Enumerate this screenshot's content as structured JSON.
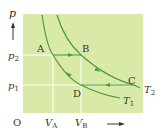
{
  "figure": {
    "type": "p-V diagram",
    "colors": {
      "background": "#ffffff",
      "plot_area": "#d9eaa8",
      "curve": "#4f9a3c",
      "guide_lines": "#ffffff",
      "text": "#333333"
    },
    "axes": {
      "y_label": "p",
      "x_arrow": "right-arrow",
      "origin_label": "O"
    },
    "ticks": {
      "y": [
        {
          "label": "p",
          "sub": "2",
          "level": "p2"
        },
        {
          "label": "p",
          "sub": "1",
          "level": "p1"
        }
      ],
      "x": [
        {
          "label": "V",
          "sub": "A",
          "level": "VA"
        },
        {
          "label": "V",
          "sub": "B",
          "level": "VB"
        }
      ]
    },
    "points": [
      {
        "name": "A",
        "p": "p2",
        "V": "VA"
      },
      {
        "name": "B",
        "p": "p2",
        "V": "VB"
      },
      {
        "name": "C",
        "p": "p1",
        "V": "VC"
      },
      {
        "name": "D",
        "p": "p1",
        "V": "VB"
      }
    ],
    "curves": [
      {
        "label": "T",
        "sub": "1",
        "kind": "isotherm",
        "through": [
          "A",
          "D"
        ]
      },
      {
        "label": "T",
        "sub": "2",
        "kind": "isotherm",
        "through": [
          "B",
          "C"
        ]
      }
    ],
    "cycle": [
      "A",
      "B",
      "C",
      "D",
      "A"
    ],
    "process_arrows": [
      {
        "from": "A",
        "to": "B",
        "direction": "right"
      },
      {
        "from": "B",
        "to": "C",
        "direction": "down-right"
      },
      {
        "from": "C",
        "to": "D",
        "direction": "left"
      },
      {
        "from": "D",
        "to": "A",
        "direction": "up-left"
      }
    ]
  }
}
